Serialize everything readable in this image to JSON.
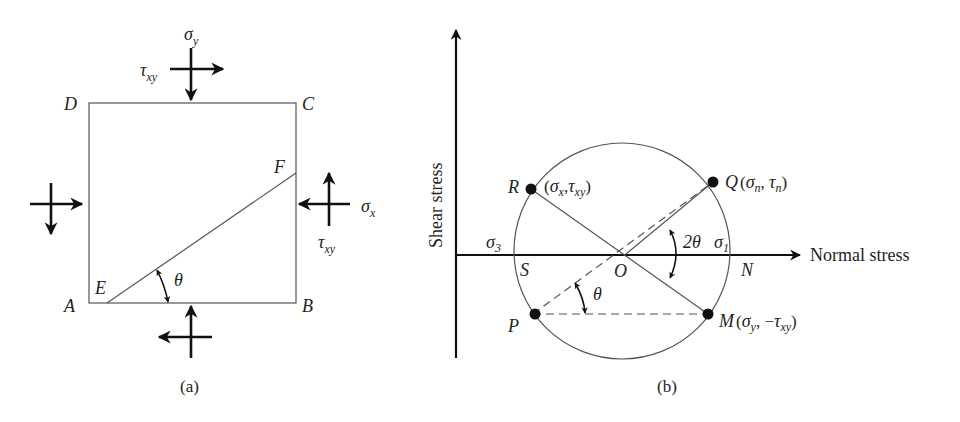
{
  "panel_a": {
    "caption": "(a)",
    "corners": {
      "A": "A",
      "B": "B",
      "C": "C",
      "D": "D"
    },
    "plane_points": {
      "E": "E",
      "F": "F"
    },
    "angle_label": "θ",
    "stress_labels": {
      "sigma_y": {
        "base": "σ",
        "sub": "y"
      },
      "sigma_x": {
        "base": "σ",
        "sub": "x"
      },
      "tau_top": {
        "base": "τ",
        "sub": "xy"
      },
      "tau_right": {
        "base": "τ",
        "sub": "xy"
      }
    }
  },
  "panel_b": {
    "caption": "(b)",
    "x_axis_label": "Normal stress",
    "y_axis_label": "Shear stress",
    "sigma3": {
      "base": "σ",
      "sub": "3"
    },
    "sigma1": {
      "base": "σ",
      "sub": "1"
    },
    "angle_2theta": "2θ",
    "angle_theta": "θ",
    "points": {
      "R": {
        "name": "R",
        "coord": "(σx,τxy)"
      },
      "Q": {
        "name": "Q",
        "coord": "(σn, τn)"
      },
      "P": {
        "name": "P"
      },
      "M": {
        "name": "M",
        "coord": "(σy, −τxy)"
      },
      "S": {
        "name": "S"
      },
      "O": {
        "name": "O"
      },
      "N": {
        "name": "N"
      }
    }
  },
  "colors": {
    "ink": "#231f20",
    "line": "#555555",
    "background": "#ffffff"
  }
}
